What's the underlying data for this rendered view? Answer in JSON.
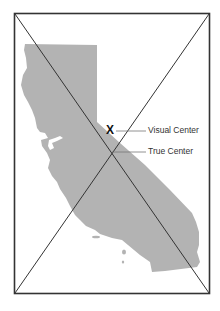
{
  "diagram": {
    "marker_glyph": "X",
    "labels": {
      "visual_center": "Visual Center",
      "true_center": "True Center"
    },
    "colors": {
      "frame": "#333333",
      "shape_fill": "#b3b3b3",
      "diagonals": "#333333",
      "leader_lines": "#666666",
      "background": "#ffffff"
    }
  }
}
